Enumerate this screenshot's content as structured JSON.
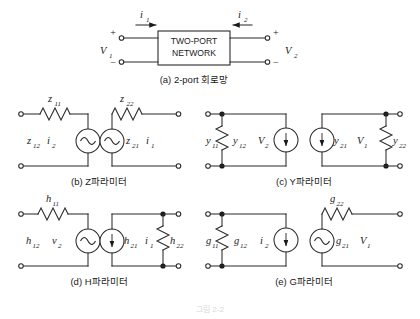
{
  "figure": {
    "title_caption": "",
    "bottom_faint_text": "그림 2-2",
    "panels": [
      {
        "id": "a",
        "caption": "(a) 2-port 회로망",
        "block_line1": "TWO-PORT",
        "block_line2": "NETWORK",
        "current_left": "i",
        "current_left_sub": "1",
        "current_right": "i",
        "current_right_sub": "2",
        "voltage_left": "V",
        "voltage_left_sub": "1",
        "voltage_right": "V",
        "voltage_right_sub": "2",
        "plus": "+",
        "minus": "−"
      },
      {
        "id": "b",
        "caption": "(b) Z파라미터",
        "elements": [
          {
            "name": "resistor-z11",
            "sym": "z",
            "sub": "11"
          },
          {
            "name": "source-z12-i2",
            "sym": "z",
            "sub": "12",
            "sym2": "i",
            "sub2": "2"
          },
          {
            "name": "source-z21-i1",
            "sym": "z",
            "sub": "21",
            "sym2": "i",
            "sub2": "1"
          },
          {
            "name": "resistor-z22",
            "sym": "z",
            "sub": "22"
          }
        ]
      },
      {
        "id": "c",
        "caption": "(c) Y파라미터",
        "elements": [
          {
            "name": "resistor-y11",
            "sym": "y",
            "sub": "11"
          },
          {
            "name": "source-y12-V2",
            "sym": "y",
            "sub": "12",
            "sym2": "V",
            "sub2": "2"
          },
          {
            "name": "source-y21-V1",
            "sym": "y",
            "sub": "21",
            "sym2": "V",
            "sub2": "1"
          },
          {
            "name": "resistor-y22",
            "sym": "y",
            "sub": "22"
          }
        ]
      },
      {
        "id": "d",
        "caption": "(d) H파라미터",
        "elements": [
          {
            "name": "resistor-h11",
            "sym": "h",
            "sub": "11"
          },
          {
            "name": "source-h12-v2",
            "sym": "h",
            "sub": "12",
            "sym2": "v",
            "sub2": "2"
          },
          {
            "name": "source-h21-i1",
            "sym": "h",
            "sub": "21",
            "sym2": "i",
            "sub2": "1"
          },
          {
            "name": "resistor-h22",
            "sym": "h",
            "sub": "22"
          }
        ]
      },
      {
        "id": "e",
        "caption": "(e) G파라미터",
        "elements": [
          {
            "name": "resistor-g11",
            "sym": "g",
            "sub": "11"
          },
          {
            "name": "source-g12-i2",
            "sym": "g",
            "sub": "12",
            "sym2": "i",
            "sub2": "2"
          },
          {
            "name": "source-g21-V1",
            "sym": "g",
            "sub": "21",
            "sym2": "V",
            "sub2": "1"
          },
          {
            "name": "resistor-g22",
            "sym": "g",
            "sub": "22"
          }
        ]
      }
    ]
  }
}
